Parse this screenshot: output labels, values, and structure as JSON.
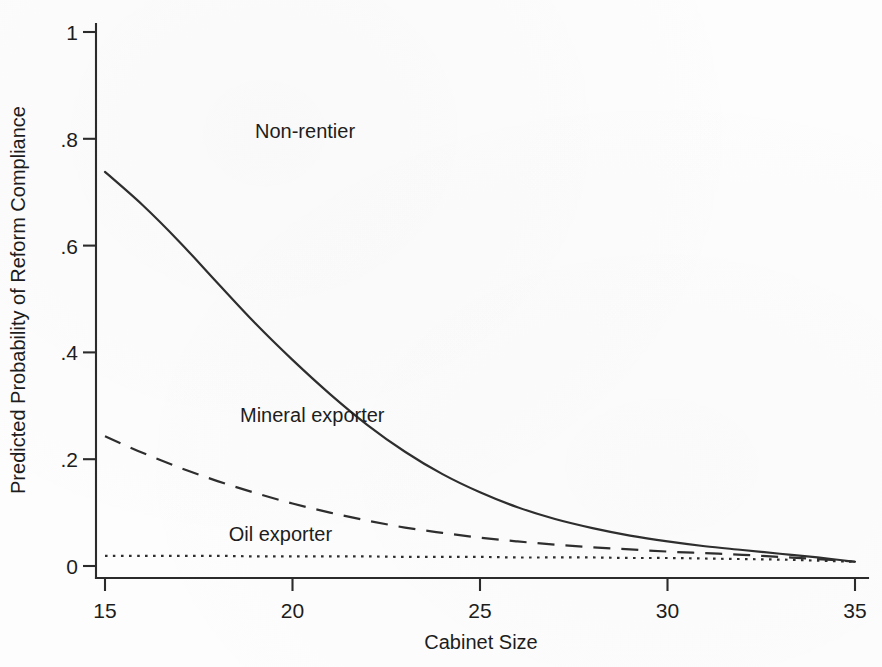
{
  "chart_data": {
    "type": "line",
    "title": "",
    "xlabel": "Cabinet Size",
    "ylabel": "Predicted Probability of Reform Compliance",
    "xlim": [
      15,
      35
    ],
    "ylim": [
      0,
      1
    ],
    "grid": false,
    "legend_position": "inline-labels",
    "x_ticks": [
      "15",
      "20",
      "25",
      "30",
      "35"
    ],
    "x_tick_values": [
      15,
      20,
      25,
      30,
      35
    ],
    "y_ticks": [
      "0",
      ".2",
      ".4",
      ".6",
      ".8",
      "1"
    ],
    "y_tick_values": [
      0,
      0.2,
      0.4,
      0.6,
      0.8,
      1
    ],
    "x": [
      15,
      16,
      17,
      18,
      19,
      20,
      21,
      22,
      23,
      24,
      25,
      26,
      27,
      28,
      29,
      30,
      31,
      32,
      33,
      34,
      35
    ],
    "series": [
      {
        "name": "Non-rentier",
        "style": "solid",
        "label_x": 19.0,
        "label_y": 0.815,
        "values": [
          0.738,
          0.676,
          0.606,
          0.53,
          0.455,
          0.386,
          0.322,
          0.264,
          0.214,
          0.172,
          0.138,
          0.11,
          0.088,
          0.071,
          0.057,
          0.046,
          0.037,
          0.03,
          0.023,
          0.016,
          0.008
        ]
      },
      {
        "name": "Mineral exporter",
        "style": "dashed",
        "label_x": 18.6,
        "label_y": 0.283,
        "values": [
          0.243,
          0.212,
          0.184,
          0.159,
          0.137,
          0.117,
          0.1,
          0.085,
          0.072,
          0.062,
          0.053,
          0.046,
          0.04,
          0.035,
          0.031,
          0.027,
          0.024,
          0.021,
          0.017,
          0.013,
          0.008
        ]
      },
      {
        "name": "Oil exporter",
        "style": "dotted",
        "label_x": 18.3,
        "label_y": 0.06,
        "values": [
          0.019,
          0.019,
          0.019,
          0.019,
          0.018,
          0.018,
          0.018,
          0.018,
          0.017,
          0.017,
          0.017,
          0.016,
          0.016,
          0.016,
          0.015,
          0.015,
          0.014,
          0.013,
          0.012,
          0.01,
          0.008
        ]
      }
    ],
    "colors": {
      "ink": "#2e2e2e",
      "axis": "#2b2b2b",
      "background": "#ffffff"
    }
  }
}
